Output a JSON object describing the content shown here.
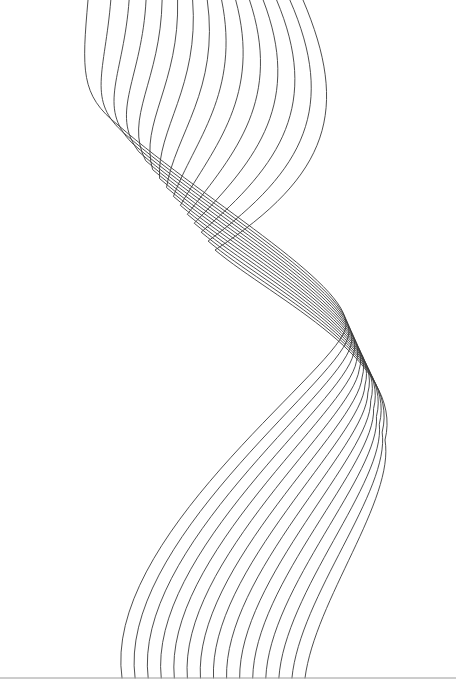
{
  "artwork": {
    "description": "Twisting ribbon of thin parallel curved lines (line-art)",
    "width": 456,
    "height": 699,
    "background_color": "#ffffff",
    "stroke_color": "#3a3a3a",
    "baseline_color": "#9a9a9a",
    "baseline_y": 678,
    "strand_count": 15,
    "top_x_range": [
      88,
      303
    ],
    "bottom_x_range": [
      122,
      305
    ]
  }
}
